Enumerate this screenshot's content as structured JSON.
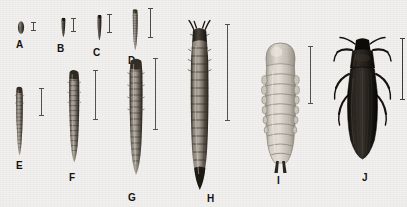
{
  "figure": {
    "background_color": "#f1f0ee",
    "ink_color": "#1a1714",
    "label_color": "#15120f",
    "scalebar_color": "#5a5754",
    "caption": ""
  },
  "specimens": [
    {
      "id": "A",
      "label": "A",
      "stage_name": "egg",
      "body_kind": "egg",
      "tone_top": "#3b3630",
      "tone_mid": "#6f6860",
      "tone_bottom": "#2a2621",
      "label_x": 16,
      "label_y": 40,
      "scalebar": {
        "x": 30,
        "y": 22,
        "height": 9
      }
    },
    {
      "id": "B",
      "label": "B",
      "stage_name": "first-instar-larva",
      "body_kind": "larva-dark",
      "tone_top": "#2e2a25",
      "tone_mid": "#5e574f",
      "tone_bottom": "#211d19",
      "label_x": 57,
      "label_y": 44,
      "scalebar": {
        "x": 70,
        "y": 18,
        "height": 14
      }
    },
    {
      "id": "C",
      "label": "C",
      "stage_name": "second-instar-larva",
      "body_kind": "larva-dark",
      "tone_top": "#2b2722",
      "tone_mid": "#5b544c",
      "tone_bottom": "#201c18",
      "label_x": 93,
      "label_y": 48,
      "scalebar": {
        "x": 106,
        "y": 14,
        "height": 19
      }
    },
    {
      "id": "D",
      "label": "D",
      "stage_name": "third-instar-larva",
      "body_kind": "larva-segmented",
      "tone_top": "#4a443c",
      "tone_mid": "#8e877d",
      "tone_bottom": "#3a342d",
      "label_x": 128,
      "label_y": 56,
      "scalebar": {
        "x": 147,
        "y": 8,
        "height": 30
      }
    },
    {
      "id": "E",
      "label": "E",
      "stage_name": "fourth-instar-larva",
      "body_kind": "larva-segmented",
      "tone_top": "#463f38",
      "tone_mid": "#8b847a",
      "tone_bottom": "#35302a",
      "label_x": 16,
      "label_y": 163,
      "scalebar": {
        "x": 38,
        "y": 88,
        "height": 28
      }
    },
    {
      "id": "F",
      "label": "F",
      "stage_name": "fifth-instar-larva",
      "body_kind": "larva-segmented",
      "tone_top": "#443d35",
      "tone_mid": "#8d867c",
      "tone_bottom": "#332e28",
      "label_x": 69,
      "label_y": 175,
      "scalebar": {
        "x": 92,
        "y": 70,
        "height": 50
      }
    },
    {
      "id": "G",
      "label": "G",
      "stage_name": "sixth-instar-larva",
      "body_kind": "larva-segmented",
      "tone_top": "#443d35",
      "tone_mid": "#918a80",
      "tone_bottom": "#322d27",
      "label_x": 128,
      "label_y": 195,
      "scalebar": {
        "x": 152,
        "y": 58,
        "height": 72
      }
    },
    {
      "id": "H",
      "label": "H",
      "stage_name": "mature-larva",
      "body_kind": "larva-large",
      "tone_top": "#3b342c",
      "tone_mid": "#948d83",
      "tone_bottom": "#2a251f",
      "label_x": 207,
      "label_y": 196,
      "scalebar": {
        "x": 224,
        "y": 24,
        "height": 97
      }
    },
    {
      "id": "I",
      "label": "I",
      "stage_name": "pupa",
      "body_kind": "pupa",
      "tone_top": "#c9c4ba",
      "tone_mid": "#ded9d0",
      "tone_bottom": "#a9a399",
      "label_x": 276,
      "label_y": 178,
      "scalebar": {
        "x": 307,
        "y": 46,
        "height": 58
      }
    },
    {
      "id": "J",
      "label": "J",
      "stage_name": "adult-beetle",
      "body_kind": "beetle",
      "tone_top": "#17140f",
      "tone_mid": "#221e18",
      "tone_bottom": "#0d0b08",
      "label_x": 363,
      "label_y": 175,
      "scalebar": {
        "x": 399,
        "y": 38,
        "height": 62
      }
    }
  ]
}
